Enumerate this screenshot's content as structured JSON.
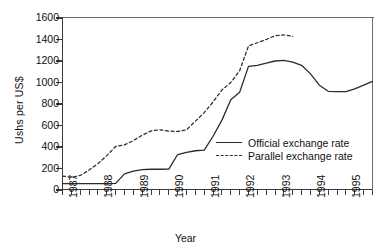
{
  "chart_data": {
    "type": "line",
    "title": "",
    "xlabel": "Year",
    "ylabel": "Ushs per US$",
    "ylim": [
      0,
      1600
    ],
    "yticks": [
      0,
      200,
      400,
      600,
      800,
      1000,
      1200,
      1400,
      1600
    ],
    "xlim": [
      1987.0,
      1995.75
    ],
    "xtick_labels": [
      "1987",
      "1988",
      "1989",
      "1990",
      "1991",
      "1992",
      "1993",
      "1994",
      "1995"
    ],
    "xtick_values": [
      1987,
      1988,
      1989,
      1990,
      1991,
      1992,
      1993,
      1994,
      1995
    ],
    "minor_tick_interval_years": 0.25,
    "grid": false,
    "legend_position": "center-right-inside",
    "series": [
      {
        "name": "Official exchange rate",
        "style": "solid",
        "color": "#2b2b2b",
        "x": [
          1987.0,
          1987.25,
          1987.5,
          1987.75,
          1988.0,
          1988.25,
          1988.5,
          1988.75,
          1989.0,
          1989.25,
          1989.5,
          1989.75,
          1990.0,
          1990.25,
          1990.5,
          1990.75,
          1991.0,
          1991.25,
          1991.5,
          1991.75,
          1992.0,
          1992.25,
          1992.5,
          1992.75,
          1993.0,
          1993.25,
          1993.5,
          1993.75,
          1994.0,
          1994.25,
          1994.5,
          1994.75,
          1995.0,
          1995.25,
          1995.5,
          1995.75
        ],
        "y": [
          60,
          60,
          60,
          60,
          60,
          60,
          62,
          150,
          175,
          190,
          193,
          193,
          195,
          330,
          350,
          365,
          370,
          500,
          650,
          840,
          910,
          1150,
          1160,
          1180,
          1200,
          1205,
          1190,
          1160,
          1080,
          975,
          918,
          915,
          915,
          940,
          975,
          1010
        ]
      },
      {
        "name": "Parallel exchange rate",
        "style": "dashed",
        "color": "#2b2b2b",
        "x": [
          1987.0,
          1987.25,
          1987.5,
          1987.75,
          1988.0,
          1988.25,
          1988.5,
          1988.75,
          1989.0,
          1989.25,
          1989.5,
          1989.75,
          1990.0,
          1990.25,
          1990.5,
          1990.75,
          1991.0,
          1991.25,
          1991.5,
          1991.75,
          1992.0,
          1992.25,
          1992.5,
          1992.75,
          1993.0,
          1993.25,
          1993.5
        ],
        "y": [
          130,
          118,
          135,
          185,
          245,
          320,
          405,
          420,
          460,
          510,
          550,
          560,
          548,
          545,
          560,
          640,
          720,
          820,
          930,
          1000,
          1110,
          1340,
          1370,
          1400,
          1435,
          1443,
          1430
        ]
      }
    ]
  }
}
